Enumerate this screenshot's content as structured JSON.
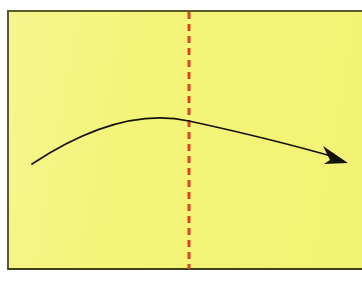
{
  "figure": {
    "title": "Origami fold step diagram",
    "canvas": {
      "width": 362,
      "height": 282,
      "background": "#ffffff"
    }
  },
  "paper": {
    "label": "origami-paper-sheet",
    "fill": "#f4f478",
    "border_color": "#5c5a2a",
    "border_width": 2,
    "x": 7,
    "y": 10,
    "width": 355,
    "height": 260
  },
  "crease_line": {
    "label": "fold-crease-line",
    "style": "dashed",
    "orientation": "vertical",
    "color": "#d8442a",
    "stroke_width": 3,
    "dash_length": 7,
    "gap_length": 5,
    "x": 189,
    "y_start": 12,
    "y_end": 269
  },
  "fold_arrow": {
    "label": "fold-direction-arrow",
    "color": "#151208",
    "stroke_width": 1.7,
    "path": "M 32 164 Q 120 106 189 121 Q 272 139 338 158",
    "start_point": [
      32,
      164
    ],
    "apex_point": [
      189,
      121
    ],
    "end_point": [
      338,
      158
    ],
    "arrowhead": {
      "label": "arrowhead-triangle",
      "tip": [
        348,
        163
      ],
      "points": "348,163 323,146 330,160 324,164",
      "fill": "#151208"
    }
  }
}
